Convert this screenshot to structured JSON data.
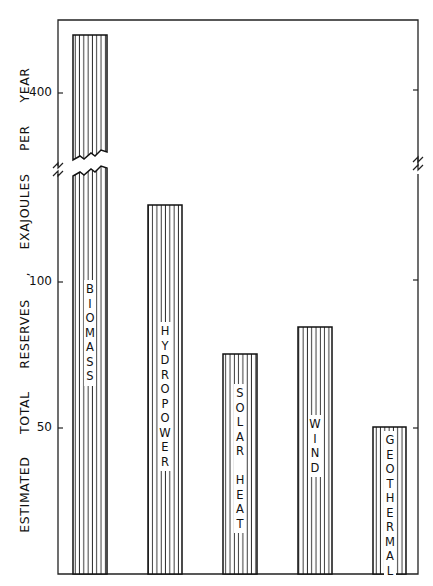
{
  "chart_data": {
    "type": "bar",
    "title": "",
    "xlabel": "",
    "ylabel": "ESTIMATED TOTAL RESERVES , EXAJOULES PER YEAR",
    "categories": [
      "BIOMASS",
      "HYDROPOWER",
      "SOLAR HEAT",
      "WIND",
      "GEOTHERMAL"
    ],
    "values": [
      420,
      126,
      75,
      84,
      50
    ],
    "y_tick_labels": [
      "50",
      "100",
      "400"
    ],
    "y_ticks": [
      50,
      100,
      400
    ],
    "axis_break": {
      "between": [
        130,
        380
      ],
      "marks": "zigzag on both axes and through BIOMASS bar"
    },
    "ylim": [
      0,
      420
    ],
    "fill_pattern": "vertical hatching",
    "grid": false,
    "legend": null
  },
  "axis": {
    "ylabel": "ESTIMATED TOTAL RESERVES , EXAJOULES PER YEAR",
    "ticks": [
      {
        "label": "400",
        "y": 93
      },
      {
        "label": "100",
        "y": 282
      },
      {
        "label": "50",
        "y": 428
      }
    ]
  },
  "bars": [
    {
      "label": "BIOMASS",
      "letters": [
        "B",
        "I",
        "O",
        "M",
        "A",
        "S",
        "S"
      ],
      "x": 73,
      "top": 35,
      "label_top": 280
    },
    {
      "label": "HYDROPOWER",
      "letters": [
        "H",
        "Y",
        "D",
        "R",
        "O",
        "P",
        "O",
        "W",
        "E",
        "R"
      ],
      "x": 148,
      "top": 205,
      "label_top": 322
    },
    {
      "label": "SOLAR HEAT",
      "letters": [
        "S",
        "O",
        "L",
        "A",
        "R",
        " ",
        "H",
        "E",
        "A",
        "T"
      ],
      "x": 223,
      "top": 354,
      "label_top": 384
    },
    {
      "label": "WIND",
      "letters": [
        "W",
        "I",
        "N",
        "D"
      ],
      "x": 298,
      "top": 327,
      "label_top": 415
    },
    {
      "label": "GEOTHERMAL",
      "letters": [
        "G",
        "E",
        "O",
        "T",
        "H",
        "E",
        "R",
        "M",
        "A",
        "L"
      ],
      "x": 373,
      "top": 427,
      "label_top": 431
    }
  ]
}
